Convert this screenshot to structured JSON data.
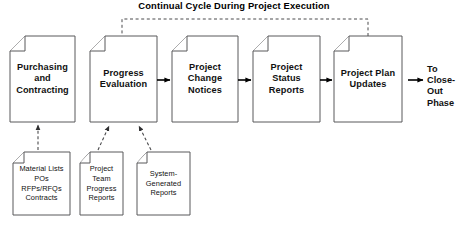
{
  "diagram": {
    "title": "Continual Cycle During Project Execution",
    "type": "process-flow-diagram",
    "background_color": "#ffffff",
    "line_color": "#58585a",
    "text_color": "#111111"
  },
  "main_flow": {
    "steps": [
      {
        "id": "purchasing-and-contracting",
        "lines": [
          "Purchasing",
          "and",
          "Contracting"
        ],
        "shape": "document"
      },
      {
        "id": "progress-evaluation",
        "lines": [
          "Progress",
          "Evaluation"
        ],
        "shape": "document"
      },
      {
        "id": "project-change-notices",
        "lines": [
          "Project",
          "Change",
          "Notices"
        ],
        "shape": "document"
      },
      {
        "id": "project-status-reports",
        "lines": [
          "Project",
          "Status",
          "Reports"
        ],
        "shape": "document"
      },
      {
        "id": "project-plan-updates",
        "lines": [
          "Project Plan",
          "Updates"
        ],
        "shape": "document"
      }
    ]
  },
  "terminal": {
    "id": "to-close-out-phase",
    "lines": [
      "To",
      "Close-Out",
      "Phase"
    ]
  },
  "inputs": {
    "documents": [
      {
        "id": "procurement-documents",
        "lines": [
          "Material Lists",
          "POs",
          "RFPs/RFQs",
          "Contracts"
        ],
        "feeds": "purchasing-and-contracting"
      },
      {
        "id": "project-team-progress-reports",
        "lines": [
          "Project",
          "Team",
          "Progress",
          "Reports"
        ],
        "feeds": "progress-evaluation"
      },
      {
        "id": "system-generated-reports",
        "lines": [
          "System-",
          "Generated",
          "Reports"
        ],
        "feeds": "progress-evaluation"
      }
    ]
  },
  "feedback_loop": {
    "label": "Continual Cycle During Project Execution",
    "from": "project-plan-updates",
    "to": "progress-evaluation",
    "style": "dashed"
  }
}
